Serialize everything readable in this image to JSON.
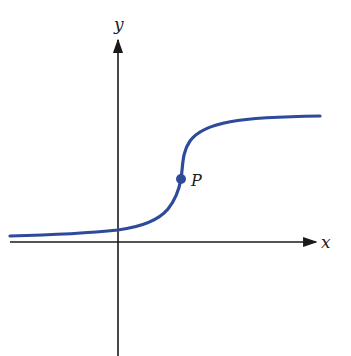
{
  "diagram": {
    "type": "function-graph",
    "axes": {
      "x_label": "x",
      "y_label": "y",
      "color": "#1a1a1a"
    },
    "curve": {
      "color": "#2e4a9a",
      "description": "S-shaped curve with vertical tangent at P"
    },
    "point": {
      "label": "P",
      "color": "#2e4a9a"
    }
  }
}
